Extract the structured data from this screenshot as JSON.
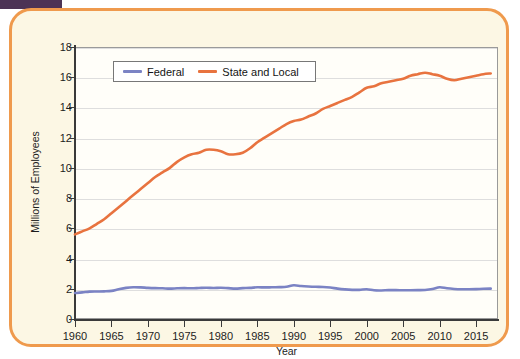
{
  "figure": {
    "card_border_color": "#ef9a4d",
    "card_background": "#fcf7e4",
    "plot_background": "#fffef9",
    "marker_bar_color": "#4c3355"
  },
  "legend": {
    "position": "top-left-inside",
    "entries": [
      {
        "label": "Federal",
        "color": "#7b83c4"
      },
      {
        "label": "State and Local",
        "color": "#e8733f"
      }
    ]
  },
  "chart_data": {
    "type": "line",
    "title": "",
    "xlabel": "Year",
    "ylabel": "Millions of Employees",
    "xlim": [
      1960,
      2018
    ],
    "ylim": [
      0,
      18
    ],
    "yticks": [
      0,
      2,
      4,
      6,
      8,
      10,
      12,
      14,
      16,
      18
    ],
    "xticks": [
      1960,
      1965,
      1970,
      1975,
      1980,
      1985,
      1990,
      1995,
      2000,
      2005,
      2010,
      2015
    ],
    "grid": "horizontal",
    "legend": [
      "Federal",
      "State and Local"
    ],
    "x": [
      1960,
      1961,
      1962,
      1963,
      1964,
      1965,
      1966,
      1967,
      1968,
      1969,
      1970,
      1971,
      1972,
      1973,
      1974,
      1975,
      1976,
      1977,
      1978,
      1979,
      1980,
      1981,
      1982,
      1983,
      1984,
      1985,
      1986,
      1987,
      1988,
      1989,
      1990,
      1991,
      1992,
      1993,
      1994,
      1995,
      1996,
      1997,
      1998,
      1999,
      2000,
      2001,
      2002,
      2003,
      2004,
      2005,
      2006,
      2007,
      2008,
      2009,
      2010,
      2011,
      2012,
      2013,
      2014,
      2015,
      2016,
      2017
    ],
    "series": [
      {
        "name": "Federal",
        "color": "#7b83c4",
        "values": [
          1.72,
          1.76,
          1.81,
          1.82,
          1.83,
          1.86,
          1.97,
          2.06,
          2.1,
          2.09,
          2.06,
          2.04,
          2.03,
          2.01,
          2.03,
          2.04,
          2.03,
          2.05,
          2.07,
          2.05,
          2.07,
          2.04,
          2.01,
          2.04,
          2.06,
          2.1,
          2.09,
          2.1,
          2.11,
          2.13,
          2.23,
          2.18,
          2.15,
          2.13,
          2.12,
          2.08,
          2.01,
          1.96,
          1.93,
          1.93,
          1.97,
          1.9,
          1.89,
          1.91,
          1.91,
          1.9,
          1.9,
          1.91,
          1.92,
          1.98,
          2.1,
          2.03,
          1.99,
          1.97,
          1.97,
          1.98,
          2.0,
          2.01
        ]
      },
      {
        "name": "State and Local",
        "color": "#e8733f",
        "values": [
          5.6,
          5.8,
          6.0,
          6.3,
          6.6,
          7.0,
          7.4,
          7.8,
          8.2,
          8.6,
          9.0,
          9.4,
          9.7,
          10.0,
          10.4,
          10.7,
          10.9,
          11.0,
          11.2,
          11.2,
          11.1,
          10.9,
          10.9,
          11.0,
          11.3,
          11.7,
          12.0,
          12.3,
          12.6,
          12.9,
          13.1,
          13.2,
          13.4,
          13.6,
          13.9,
          14.1,
          14.3,
          14.5,
          14.7,
          15.0,
          15.3,
          15.4,
          15.6,
          15.7,
          15.8,
          15.9,
          16.1,
          16.2,
          16.3,
          16.2,
          16.1,
          15.9,
          15.8,
          15.9,
          16.0,
          16.1,
          16.2,
          16.25
        ]
      }
    ]
  }
}
